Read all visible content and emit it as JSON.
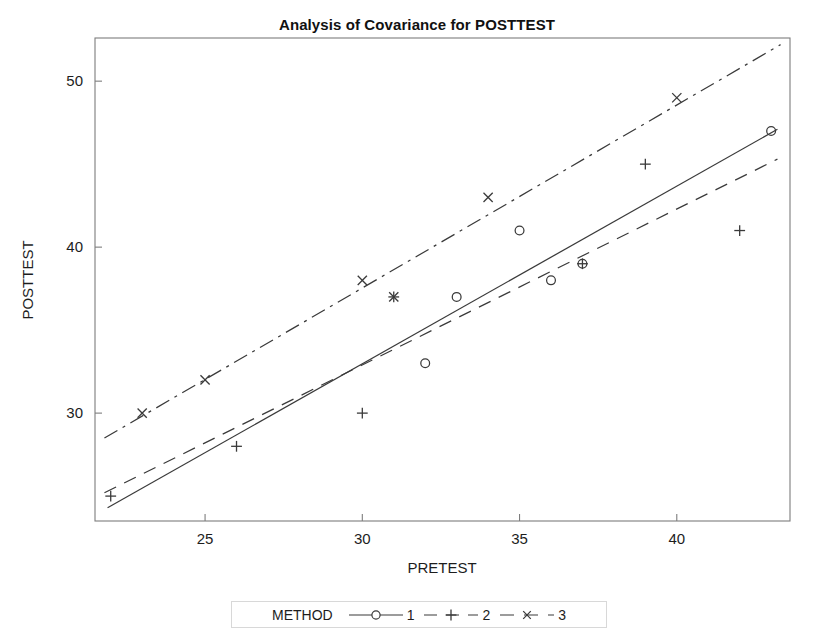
{
  "chart_data": {
    "type": "scatter",
    "title": "Analysis of Covariance for POSTTEST",
    "xlabel": "PRETEST",
    "ylabel": "POSTTEST",
    "xlim": [
      21.5,
      43.6
    ],
    "ylim": [
      23.5,
      52.6
    ],
    "xticks": [
      25,
      30,
      35,
      40
    ],
    "yticks": [
      30,
      40,
      50
    ],
    "grid": false,
    "legend_position": "bottom",
    "legend_title": "METHOD",
    "series": [
      {
        "name": "1",
        "marker": "circle",
        "line_style": "solid",
        "color": "#3a3a3a",
        "points": [
          {
            "x": 32,
            "y": 33
          },
          {
            "x": 33,
            "y": 37
          },
          {
            "x": 35,
            "y": 41
          },
          {
            "x": 36,
            "y": 38
          },
          {
            "x": 37,
            "y": 39
          },
          {
            "x": 43,
            "y": 47
          }
        ],
        "fit_line": {
          "x1": 21.9,
          "y1": 24.3,
          "x2": 43.2,
          "y2": 47.1
        }
      },
      {
        "name": "2",
        "marker": "plus",
        "line_style": "dashed",
        "color": "#3a3a3a",
        "points": [
          {
            "x": 22,
            "y": 25
          },
          {
            "x": 26,
            "y": 28
          },
          {
            "x": 30,
            "y": 30
          },
          {
            "x": 31,
            "y": 37
          },
          {
            "x": 37,
            "y": 39
          },
          {
            "x": 39,
            "y": 45
          },
          {
            "x": 42,
            "y": 41
          }
        ],
        "fit_line": {
          "x1": 21.8,
          "y1": 25.2,
          "x2": 43.2,
          "y2": 45.3
        }
      },
      {
        "name": "3",
        "marker": "cross",
        "line_style": "dashdot",
        "color": "#3a3a3a",
        "points": [
          {
            "x": 23,
            "y": 30
          },
          {
            "x": 25,
            "y": 32
          },
          {
            "x": 30,
            "y": 38
          },
          {
            "x": 31,
            "y": 37
          },
          {
            "x": 34,
            "y": 43
          },
          {
            "x": 40,
            "y": 49
          }
        ],
        "fit_line": {
          "x1": 21.8,
          "y1": 28.5,
          "x2": 43.3,
          "y2": 52.2
        }
      }
    ]
  },
  "legend": {
    "title": "METHOD",
    "entries": [
      {
        "label": "1"
      },
      {
        "label": "2"
      },
      {
        "label": "3"
      }
    ]
  },
  "axes": {
    "x_title": "PRETEST",
    "y_title": "POSTTEST",
    "x_tick_labels": [
      "25",
      "30",
      "35",
      "40"
    ],
    "y_tick_labels": [
      "30",
      "40",
      "50"
    ]
  },
  "title": "Analysis of Covariance for POSTTEST"
}
